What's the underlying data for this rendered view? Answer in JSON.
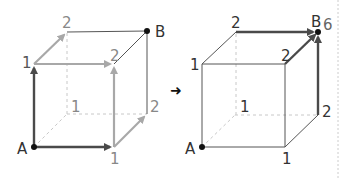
{
  "colors": {
    "edge": "#555555",
    "hidden_edge": "#bbbbbb",
    "path_dark": "#4a4a4a",
    "path_light": "#a8a8a8",
    "label": "#333333",
    "label_light": "#888888",
    "separator": "#cccccc"
  },
  "transition_arrow": "➜",
  "left_cube": {
    "name": "step-1",
    "labels": {
      "A": "A",
      "B": "B",
      "front_top_left": "1",
      "front_bottom_right": "1",
      "back_bottom_left": "1",
      "back_top_left": "2",
      "front_top_right": "2",
      "back_bottom_right": "2"
    }
  },
  "right_cube": {
    "name": "step-2",
    "labels": {
      "A": "A",
      "B": "B",
      "B_count": "6",
      "front_top_left": "1",
      "front_bottom_right": "1",
      "back_bottom_left": "1",
      "back_top_left": "2",
      "front_top_right": "2",
      "back_bottom_right": "2"
    }
  }
}
